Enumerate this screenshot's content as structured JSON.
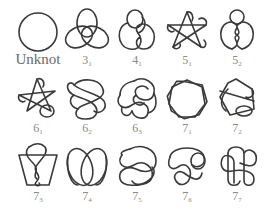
{
  "stroke_color": "#3a3a3a",
  "label_color": "#8a8a8a",
  "knots": [
    {
      "id": "unknot",
      "label": "Unknot",
      "crossings": "",
      "index": "",
      "row": 0,
      "col": 0
    },
    {
      "id": "3_1",
      "label": "3",
      "crossings": "3",
      "index": "1",
      "row": 0,
      "col": 1
    },
    {
      "id": "4_1",
      "label": "4",
      "crossings": "4",
      "index": "1",
      "row": 0,
      "col": 2
    },
    {
      "id": "5_1",
      "label": "5",
      "crossings": "5",
      "index": "1",
      "row": 0,
      "col": 3
    },
    {
      "id": "5_2",
      "label": "5",
      "crossings": "5",
      "index": "2",
      "row": 0,
      "col": 4
    },
    {
      "id": "6_1",
      "label": "6",
      "crossings": "6",
      "index": "1",
      "row": 1,
      "col": 0
    },
    {
      "id": "6_2",
      "label": "6",
      "crossings": "6",
      "index": "2",
      "row": 1,
      "col": 1
    },
    {
      "id": "6_3",
      "label": "6",
      "crossings": "6",
      "index": "3",
      "row": 1,
      "col": 2
    },
    {
      "id": "7_1",
      "label": "7",
      "crossings": "7",
      "index": "1",
      "row": 1,
      "col": 3
    },
    {
      "id": "7_2",
      "label": "7",
      "crossings": "7",
      "index": "2",
      "row": 1,
      "col": 4
    },
    {
      "id": "7_3",
      "label": "7",
      "crossings": "7",
      "index": "3",
      "row": 2,
      "col": 0
    },
    {
      "id": "7_4",
      "label": "7",
      "crossings": "7",
      "index": "4",
      "row": 2,
      "col": 1
    },
    {
      "id": "7_5",
      "label": "7",
      "crossings": "7",
      "index": "5",
      "row": 2,
      "col": 2
    },
    {
      "id": "7_6",
      "label": "7",
      "crossings": "7",
      "index": "6",
      "row": 2,
      "col": 3
    },
    {
      "id": "7_7",
      "label": "7",
      "crossings": "7",
      "index": "7",
      "row": 2,
      "col": 4
    }
  ]
}
